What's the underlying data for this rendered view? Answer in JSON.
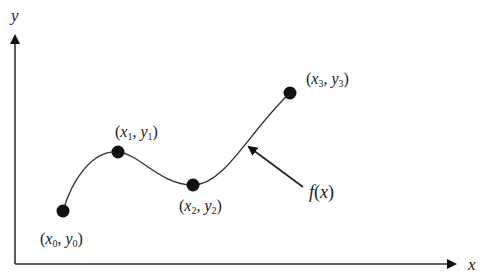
{
  "diagram": {
    "axes": {
      "x_label": "x",
      "y_label": "y"
    },
    "points": [
      {
        "id": "p0",
        "x_sym": "x",
        "y_sym": "y",
        "sub": "0",
        "cx": 63,
        "cy": 211
      },
      {
        "id": "p1",
        "x_sym": "x",
        "y_sym": "y",
        "sub": "1",
        "cx": 118,
        "cy": 152
      },
      {
        "id": "p2",
        "x_sym": "x",
        "y_sym": "y",
        "sub": "2",
        "cx": 193,
        "cy": 185
      },
      {
        "id": "p3",
        "x_sym": "x",
        "y_sym": "y",
        "sub": "3",
        "cx": 290,
        "cy": 93
      }
    ],
    "function_label": {
      "f": "f",
      "open": "(",
      "arg": "x",
      "close": ")"
    },
    "punct": {
      "open": "(",
      "comma": ", ",
      "close": ")"
    },
    "colors": {
      "line": "#333333",
      "point": "#111111",
      "text": "#1a1a1a"
    }
  }
}
